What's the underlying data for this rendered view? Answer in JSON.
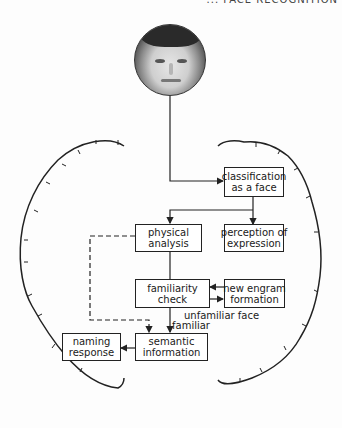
{
  "header": {
    "cropped_text": "... FACE RECOGNITION"
  },
  "photo": {
    "alt": "face photograph",
    "icon": "face-photo-icon"
  },
  "boxes": {
    "classification": {
      "line1": "classification",
      "line2": "as  a  face"
    },
    "physical": {
      "line1": "physical",
      "line2": "analysis"
    },
    "perception": {
      "line1": "perception of",
      "line2": "expression"
    },
    "familiarity": {
      "line1": "familiarity",
      "line2": "check"
    },
    "engram": {
      "line1": "new engram",
      "line2": "formation"
    },
    "semantic": {
      "line1": "semantic",
      "line2": "information"
    },
    "naming": {
      "line1": "naming",
      "line2": "response"
    }
  },
  "labels": {
    "unfamiliar": "unfamiliar   face",
    "familiar": "familiar"
  },
  "colors": {
    "line": "#222222",
    "background": "#fdfdfd"
  }
}
